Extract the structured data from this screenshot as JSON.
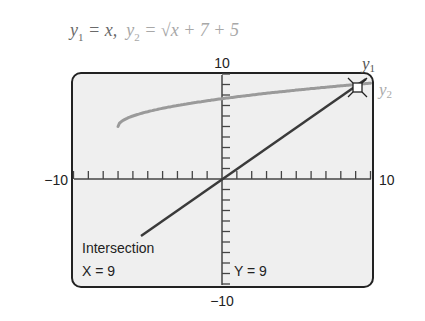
{
  "equation": {
    "y1_label": "y",
    "y1_sub": "1",
    "y1_rhs": " = x,",
    "y2_label": "y",
    "y2_sub": "2",
    "y2_rhs": " = √x + 7 + 5"
  },
  "axis_labels": {
    "ymax": "10",
    "ymin": "−10",
    "xmin": "−10",
    "xmax": "10"
  },
  "curve_labels": {
    "y1": "y",
    "y1_sub": "1",
    "y2": "y",
    "y2_sub": "2"
  },
  "readout": {
    "title": "Intersection",
    "x": "X = 9",
    "y": "Y = 9"
  },
  "colors": {
    "y1": "#3a3a3a",
    "y2": "#9a9a9a",
    "screen_bg": "#efefef",
    "frame": "#222222"
  },
  "chart_data": {
    "type": "line",
    "xlabel": "",
    "ylabel": "",
    "xlim": [
      -10,
      10
    ],
    "ylim": [
      -10,
      10
    ],
    "x_ticks_step": 1,
    "y_ticks_step": 1,
    "grid": false,
    "series": [
      {
        "name": "y1 = x",
        "x": [
          -10,
          -5,
          0,
          5,
          10
        ],
        "y": [
          -10,
          -5,
          0,
          5,
          10
        ]
      },
      {
        "name": "y2 = sqrt(x+7)+5",
        "x": [
          -7,
          -6,
          -3,
          0,
          2,
          5,
          9,
          10
        ],
        "y": [
          5,
          6,
          7,
          7.65,
          8,
          8.46,
          9,
          9.12
        ]
      }
    ],
    "annotations": [
      {
        "text": "Intersection",
        "x": 9,
        "y": 9
      },
      {
        "text": "X = 9"
      },
      {
        "text": "Y = 9"
      }
    ]
  }
}
